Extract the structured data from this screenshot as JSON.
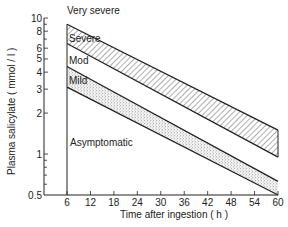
{
  "chart_data": {
    "type": "area",
    "title": "",
    "xlabel": "Time after ingestion (h)",
    "ylabel": "Plasma salicylate (mmol/l)",
    "xscale": "linear",
    "yscale": "log",
    "xlim": [
      6,
      60
    ],
    "ylim": [
      0.5,
      10
    ],
    "x_ticks": [
      6,
      12,
      18,
      24,
      30,
      36,
      42,
      48,
      54,
      60
    ],
    "y_ticks": [
      0.5,
      1,
      2,
      3,
      4,
      5,
      6,
      8,
      10
    ],
    "y_tick_labels": [
      "0.5",
      "1",
      "2",
      "3",
      "4",
      "5",
      "6",
      "8",
      "10"
    ],
    "boundary_lines": [
      {
        "name": "Very severe / Severe",
        "x": [
          6,
          60
        ],
        "y": [
          9.0,
          1.5
        ]
      },
      {
        "name": "Severe / Moderate",
        "x": [
          6,
          60
        ],
        "y": [
          6.5,
          0.95
        ]
      },
      {
        "name": "Moderate / Mild",
        "x": [
          6,
          60
        ],
        "y": [
          4.4,
          0.63
        ]
      },
      {
        "name": "Mild / Asymptomatic",
        "x": [
          6,
          60
        ],
        "y": [
          3.1,
          0.5
        ]
      }
    ],
    "regions": [
      {
        "label": "Very severe",
        "fill": "none"
      },
      {
        "label": "Severe",
        "fill": "hatched"
      },
      {
        "label": "Mod",
        "fill": "none"
      },
      {
        "label": "Mild",
        "fill": "stippled"
      },
      {
        "label": "Asymptomatic",
        "fill": "none"
      }
    ],
    "grid": false,
    "legend": "none (in-plot region labels)"
  },
  "labels": {
    "very_severe": "Very severe",
    "severe": "Severe",
    "mod": "Mod",
    "mild": "Mild",
    "asymptomatic": "Asymptomatic",
    "xlabel": "Time after ingestion ( h )",
    "ylabel": "Plasma salicylate ( mmol / l )"
  }
}
